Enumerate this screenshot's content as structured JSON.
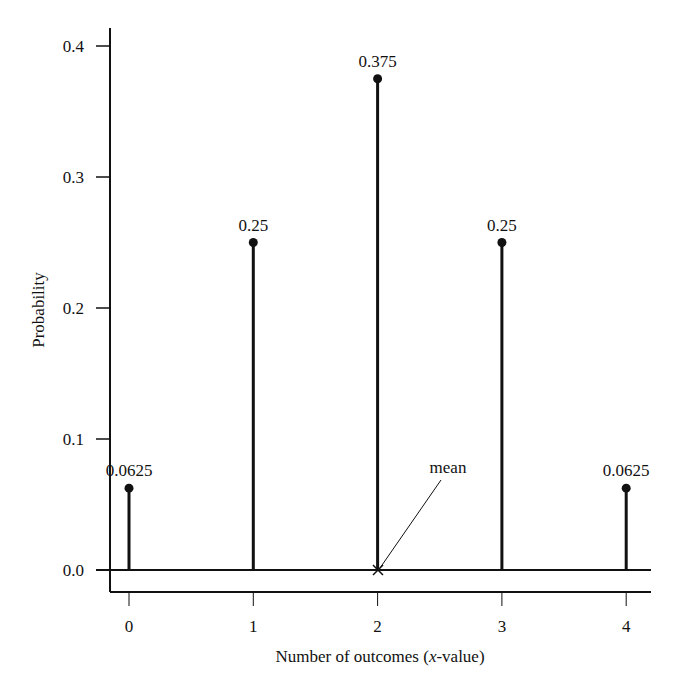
{
  "chart_data": {
    "type": "stem",
    "title": "",
    "xlabel_prefix": "Number of outcomes (",
    "xlabel_italic": "x",
    "xlabel_suffix": "-value)",
    "xlabel": "Number of outcomes (x-value)",
    "ylabel": "Probability",
    "x": [
      0,
      1,
      2,
      3,
      4
    ],
    "values": [
      0.0625,
      0.25,
      0.375,
      0.25,
      0.0625
    ],
    "value_labels": [
      "0.0625",
      "0.25",
      "0.375",
      "0.25",
      "0.0625"
    ],
    "x_tick_labels": [
      "0",
      "1",
      "2",
      "3",
      "4"
    ],
    "y_ticks": [
      0.0,
      0.1,
      0.2,
      0.3,
      0.4
    ],
    "y_tick_labels": [
      "0.0",
      "0.1",
      "0.2",
      "0.3",
      "0.4"
    ],
    "ylim": [
      -0.017,
      0.44
    ],
    "xlim": [
      -0.15,
      4.2
    ],
    "grid": false,
    "legend": null,
    "annotations": [
      {
        "text": "mean",
        "x": 2,
        "y": 0,
        "marker": "x"
      }
    ]
  }
}
